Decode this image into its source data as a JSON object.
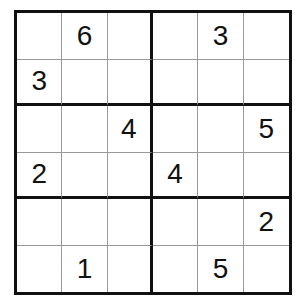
{
  "puzzle": {
    "type": "sudoku-6x6",
    "box_size": {
      "rows": 2,
      "cols": 3
    },
    "grid": [
      [
        "",
        "6",
        "",
        "",
        "3",
        ""
      ],
      [
        "3",
        "",
        "",
        "",
        "",
        ""
      ],
      [
        "",
        "",
        "4",
        "",
        "",
        "5"
      ],
      [
        "2",
        "",
        "",
        "4",
        "",
        ""
      ],
      [
        "",
        "",
        "",
        "",
        "",
        "2"
      ],
      [
        "",
        "1",
        "",
        "",
        "5",
        ""
      ]
    ]
  }
}
